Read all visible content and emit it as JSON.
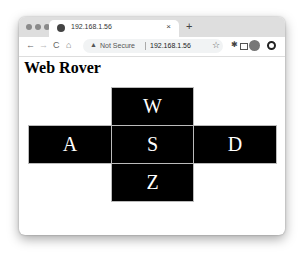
{
  "browser": {
    "tab": {
      "title": "192.168.1.56",
      "close": "×"
    },
    "new_tab": "+",
    "nav": {
      "back": "←",
      "forward": "→",
      "reload": "C",
      "home": "⌂"
    },
    "omnibox": {
      "security_icon": "▲",
      "security_label": "Not Secure",
      "url": "192.168.1.56"
    },
    "bookmark": "☆"
  },
  "page": {
    "title": "Web Rover",
    "controls": {
      "forward": "W",
      "left": "A",
      "stop": "S",
      "right": "D",
      "back": "Z"
    }
  }
}
